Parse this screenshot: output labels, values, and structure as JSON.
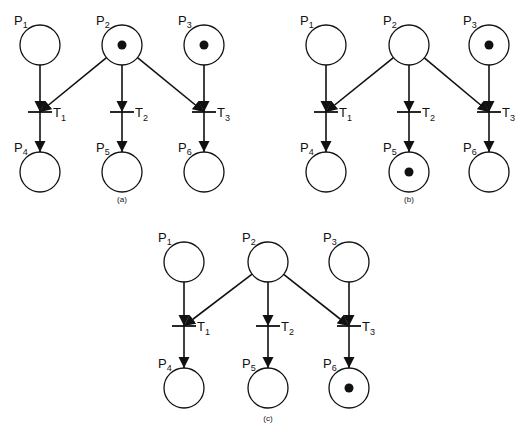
{
  "panels": [
    {
      "caption": "(a)",
      "origin": [
        0,
        0
      ],
      "places": [
        {
          "id": "P1",
          "name": "P",
          "sub": "1",
          "x": 40,
          "y": 45,
          "tokens": 0
        },
        {
          "id": "P2",
          "name": "P",
          "sub": "2",
          "x": 122,
          "y": 45,
          "tokens": 1
        },
        {
          "id": "P3",
          "name": "P",
          "sub": "3",
          "x": 204,
          "y": 45,
          "tokens": 1
        },
        {
          "id": "P4",
          "name": "P",
          "sub": "4",
          "x": 40,
          "y": 172,
          "tokens": 0
        },
        {
          "id": "P5",
          "name": "P",
          "sub": "5",
          "x": 122,
          "y": 172,
          "tokens": 0
        },
        {
          "id": "P6",
          "name": "P",
          "sub": "6",
          "x": 204,
          "y": 172,
          "tokens": 0
        }
      ],
      "transitions": [
        {
          "id": "T1",
          "name": "T",
          "sub": "1",
          "x": 40,
          "y": 112
        },
        {
          "id": "T2",
          "name": "T",
          "sub": "2",
          "x": 122,
          "y": 112
        },
        {
          "id": "T3",
          "name": "T",
          "sub": "3",
          "x": 204,
          "y": 112
        }
      ]
    },
    {
      "caption": "(b)",
      "places": [
        {
          "id": "P1",
          "name": "P",
          "sub": "1",
          "x": 326,
          "y": 45,
          "tokens": 0
        },
        {
          "id": "P2",
          "name": "P",
          "sub": "2",
          "x": 409,
          "y": 45,
          "tokens": 0
        },
        {
          "id": "P3",
          "name": "P",
          "sub": "3",
          "x": 489,
          "y": 45,
          "tokens": 1
        },
        {
          "id": "P4",
          "name": "P",
          "sub": "4",
          "x": 326,
          "y": 172,
          "tokens": 0
        },
        {
          "id": "P5",
          "name": "P",
          "sub": "5",
          "x": 409,
          "y": 172,
          "tokens": 1
        },
        {
          "id": "P6",
          "name": "P",
          "sub": "6",
          "x": 489,
          "y": 172,
          "tokens": 0
        }
      ],
      "transitions": [
        {
          "id": "T1",
          "name": "T",
          "sub": "1",
          "x": 326,
          "y": 112
        },
        {
          "id": "T2",
          "name": "T",
          "sub": "2",
          "x": 409,
          "y": 112
        },
        {
          "id": "T3",
          "name": "T",
          "sub": "3",
          "x": 489,
          "y": 112
        }
      ]
    },
    {
      "caption": "(c)",
      "places": [
        {
          "id": "P1",
          "name": "P",
          "sub": "1",
          "x": 184,
          "y": 262,
          "tokens": 0
        },
        {
          "id": "P2",
          "name": "P",
          "sub": "2",
          "x": 268,
          "y": 262,
          "tokens": 0
        },
        {
          "id": "P3",
          "name": "P",
          "sub": "3",
          "x": 349,
          "y": 262,
          "tokens": 0
        },
        {
          "id": "P4",
          "name": "P",
          "sub": "4",
          "x": 184,
          "y": 388,
          "tokens": 0
        },
        {
          "id": "P5",
          "name": "P",
          "sub": "5",
          "x": 268,
          "y": 388,
          "tokens": 0
        },
        {
          "id": "P6",
          "name": "P",
          "sub": "6",
          "x": 349,
          "y": 388,
          "tokens": 1
        }
      ],
      "transitions": [
        {
          "id": "T1",
          "name": "T",
          "sub": "1",
          "x": 184,
          "y": 326
        },
        {
          "id": "T2",
          "name": "T",
          "sub": "2",
          "x": 268,
          "y": 326
        },
        {
          "id": "T3",
          "name": "T",
          "sub": "3",
          "x": 349,
          "y": 326
        }
      ]
    }
  ],
  "captions_pos": [
    [
      122,
      202
    ],
    [
      409,
      202
    ],
    [
      268,
      421
    ]
  ],
  "arcs": [
    [
      "P1",
      "T1"
    ],
    [
      "P2",
      "T1"
    ],
    [
      "P2",
      "T2"
    ],
    [
      "P2",
      "T3"
    ],
    [
      "P3",
      "T3"
    ],
    [
      "T1",
      "P4"
    ],
    [
      "T2",
      "P5"
    ],
    [
      "T3",
      "P6"
    ]
  ],
  "colors": {
    "ink": "#111111",
    "background": "#ffffff"
  }
}
